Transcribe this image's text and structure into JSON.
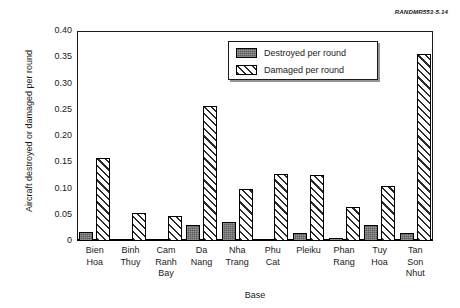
{
  "source_tag": "RANDMR553-5.14",
  "legend": {
    "position": "top-right-inside",
    "entries": [
      {
        "label": "Destroyed per round",
        "swatch": "solid-dark-gray",
        "color": "#595959"
      },
      {
        "label": "Damaged per round",
        "swatch": "diagonal-hatch",
        "color": "#ffffff"
      }
    ]
  },
  "chart_data": {
    "type": "bar",
    "title": "",
    "xlabel": "Base",
    "ylabel": "Aircraft destroyed or damaged per round",
    "ylim": [
      0,
      0.4
    ],
    "yticks": [
      0,
      0.05,
      0.1,
      0.15,
      0.2,
      0.25,
      0.3,
      0.35,
      0.4
    ],
    "ytick_labels": [
      "0",
      "0.05",
      "0.10",
      "0.15",
      "0.20",
      "0.25",
      "0.30",
      "0.35",
      "0.40"
    ],
    "grid": false,
    "legend_position": "upper right",
    "categories": [
      "Bien Hoa",
      "Binh Thuy",
      "Cam Ranh Bay",
      "Da Nang",
      "Nha Trang",
      "Phu Cat",
      "Pleiku",
      "Phan Rang",
      "Tuy Hoa",
      "Tan Son Nhut"
    ],
    "category_lines": [
      [
        "Bien",
        "Hoa"
      ],
      [
        "Binh",
        "Thuy"
      ],
      [
        "Cam",
        "Ranh",
        "Bay"
      ],
      [
        "Da",
        "Nang"
      ],
      [
        "Nha",
        "Trang"
      ],
      [
        "Phu",
        "Cat"
      ],
      [
        "Pleiku"
      ],
      [
        "Phan",
        "Rang"
      ],
      [
        "Tuy",
        "Hoa"
      ],
      [
        "Tan",
        "Son",
        "Nhut"
      ]
    ],
    "series": [
      {
        "name": "Destroyed per round",
        "color": "#595959",
        "pattern": "solid",
        "values": [
          0.018,
          0.002,
          0.0,
          0.031,
          0.036,
          0.0,
          0.016,
          0.006,
          0.03,
          0.016
        ]
      },
      {
        "name": "Damaged per round",
        "color": "#ffffff",
        "pattern": "diagonal-hatch",
        "values": [
          0.158,
          0.054,
          0.047,
          0.258,
          0.1,
          0.128,
          0.125,
          0.064,
          0.104,
          0.356
        ]
      }
    ]
  }
}
